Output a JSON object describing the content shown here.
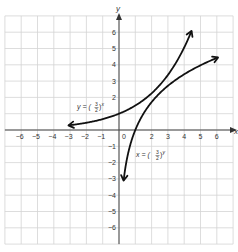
{
  "chart_data": {
    "type": "line",
    "title": "",
    "xlabel": "x",
    "ylabel": "y",
    "xlim": [
      -7,
      7
    ],
    "ylim": [
      -7,
      7
    ],
    "grid": true,
    "x_ticks": [
      "-6",
      "-5",
      "-4",
      "-3",
      "-2",
      "-1",
      "0",
      "2",
      "3",
      "4",
      "5",
      "6"
    ],
    "y_ticks": [
      "6",
      "5",
      "4",
      "3",
      "2",
      "-1",
      "-2",
      "-3",
      "-4",
      "-5",
      "-6"
    ],
    "series": [
      {
        "name": "y = (3/2)^x",
        "label_expr": "y = (3/2)^x",
        "x": [
          -3,
          -2,
          -1,
          0,
          1,
          2,
          3,
          4,
          4.4
        ],
        "values": [
          0.3,
          0.44,
          0.67,
          1.0,
          1.5,
          2.25,
          3.38,
          5.06,
          5.95
        ],
        "arrows": "both"
      },
      {
        "name": "x = (3/2)^y",
        "label_expr": "x = (3/2)^y",
        "x": [
          0.3,
          0.44,
          0.67,
          1.0,
          1.5,
          2.25,
          3.38,
          5.06,
          5.95
        ],
        "values": [
          -3,
          -2,
          -1,
          0,
          1,
          2,
          3,
          4,
          4.4
        ],
        "arrows": "both"
      }
    ],
    "annotations": [
      {
        "text": "y = (3/2)^x",
        "x": -3.4,
        "y": 1.6
      },
      {
        "text": "x = (3/2)^y",
        "x": 1.0,
        "y": -1.5
      }
    ]
  },
  "labels": {
    "x_axis": "x",
    "y_axis": "y",
    "eq1_lhs": "y  =  (",
    "eq1_num": "3",
    "eq1_den": "2",
    "eq1_rhs": ")",
    "eq1_exp": "x",
    "eq2_lhs": "x  =  (",
    "eq2_num": "3",
    "eq2_den": "2",
    "eq2_rhs": ")",
    "eq2_exp": "y"
  }
}
